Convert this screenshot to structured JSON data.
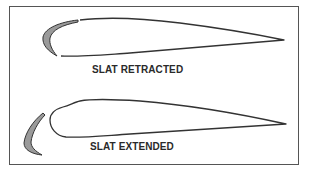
{
  "diagram": {
    "type": "airfoil-slat-comparison",
    "colors": {
      "outline": "#333333",
      "slat_fill": "#9a9a9a",
      "frame": "#555555",
      "background": "#ffffff"
    },
    "panels": [
      {
        "id": "retracted",
        "caption": "SLAT RETRACTED",
        "slat_position": "flush against leading edge"
      },
      {
        "id": "extended",
        "caption": "SLAT EXTENDED",
        "slat_position": "forward and down, gap to wing"
      }
    ]
  }
}
